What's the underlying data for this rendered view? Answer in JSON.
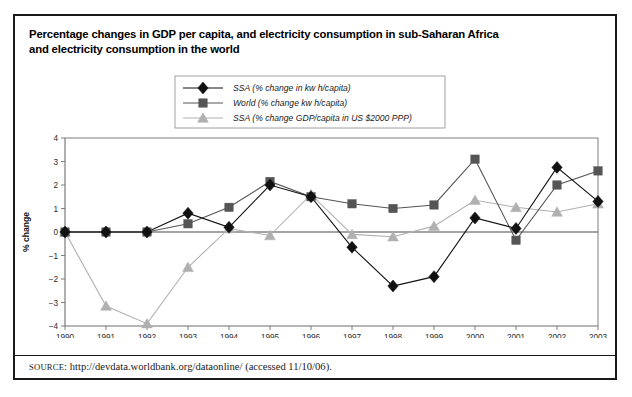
{
  "title": {
    "line1": "Percentage changes in GDP per capita, and electricity consumption in sub-Saharan Africa",
    "line2": "and electricity consumption in the world"
  },
  "source": {
    "label": "SOURCE",
    "text": ": http://devdata.worldbank.org/dataonline/ (accessed 11/10/06)."
  },
  "colors": {
    "ssa_electricity": "#111111",
    "world_electricity": "#555555",
    "ssa_gdp": "#b0b0b0",
    "axis": "#4a4a4a",
    "frame": "#1a1a1a",
    "background": "#ffffff"
  },
  "chart_data": {
    "type": "line",
    "title": "Percentage changes in GDP per capita, and electricity consumption in sub-Saharan Africa and electricity consumption in the world",
    "xlabel": "Year",
    "ylabel": "% change",
    "categories": [
      "1990",
      "1991",
      "1992",
      "1993",
      "1994",
      "1995",
      "1996",
      "1997",
      "1998",
      "1999",
      "2000",
      "2001",
      "2002",
      "2003"
    ],
    "xticklabels": [
      "1990",
      "1991",
      "1992",
      "1993",
      "1994",
      "1995",
      "1996",
      "1997",
      "1998",
      "1999",
      "2000",
      "2001",
      "2002",
      "2003"
    ],
    "yticklabels": [
      "4",
      "3",
      "2",
      "1",
      "0",
      "-1",
      "-2",
      "-3",
      "-4"
    ],
    "ylim": [
      -4,
      4
    ],
    "yticks": [
      4,
      3,
      2,
      1,
      0,
      -1,
      -2,
      -3,
      -4
    ],
    "grid": false,
    "legend_position": "top-center",
    "series": [
      {
        "name": "SSA (% change in kw h/capita)",
        "marker": "diamond",
        "color": "#111111",
        "values": [
          0.0,
          0.0,
          0.0,
          0.8,
          0.2,
          2.0,
          1.5,
          -0.65,
          -2.3,
          -1.9,
          0.6,
          0.15,
          2.75,
          1.3
        ]
      },
      {
        "name": "World (% change kw h/capita)",
        "marker": "square",
        "color": "#555555",
        "values": [
          0.0,
          0.0,
          0.0,
          0.35,
          1.05,
          2.15,
          1.5,
          1.2,
          1.0,
          1.15,
          3.1,
          -0.35,
          2.0,
          2.6
        ]
      },
      {
        "name": "SSA (% change GDP/capita in US $2000 PPP)",
        "marker": "triangle",
        "color": "#b0b0b0",
        "values": [
          0.0,
          -3.15,
          -3.9,
          -1.5,
          0.15,
          -0.15,
          1.6,
          -0.1,
          -0.2,
          0.25,
          1.35,
          1.05,
          0.85,
          1.2
        ]
      }
    ]
  }
}
